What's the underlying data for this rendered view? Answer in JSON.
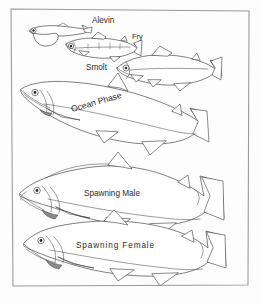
{
  "figure": {
    "frame": {
      "visible": true,
      "color": "#9a9a9a"
    },
    "background_color": "#fdfdfd",
    "line_color": "#3a3a3a",
    "text_color": "#2b2b2b"
  },
  "stages": [
    {
      "id": "alevin",
      "label": "Alevin",
      "label_x": 92,
      "label_y": 23,
      "description": "Newly hatched salmon with attached yolk sac"
    },
    {
      "id": "fry",
      "label": "Fry",
      "label_x": 132,
      "label_y": 39,
      "description": "Juvenile salmon with parr marks along the body"
    },
    {
      "id": "smolt",
      "label": "Smolt",
      "label_x": 86,
      "label_y": 70,
      "description": "Silvery juvenile migrating to the sea"
    },
    {
      "id": "ocean-phase",
      "label": "Ocean Phase",
      "label_x": 72,
      "label_y": 112,
      "label_rotation": -16,
      "description": "Mature adult salmon at sea, streamlined and silver"
    },
    {
      "id": "spawning-male",
      "label": "Spawning Male",
      "label_x": 84,
      "label_y": 196,
      "description": "Adult male with humped back and hooked kype jaw"
    },
    {
      "id": "spawning-female",
      "label": "Spawning Female",
      "label_x": 76,
      "label_y": 248,
      "description": "Adult female with rounded body profile"
    }
  ]
}
